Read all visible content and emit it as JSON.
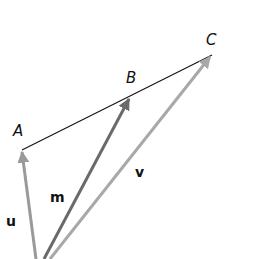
{
  "diagram": {
    "points": [
      {
        "name": "A",
        "x": 22,
        "y": 150,
        "label_x": 13,
        "label_y": 136
      },
      {
        "name": "B",
        "x": 130,
        "y": 97,
        "label_x": 126,
        "label_y": 83
      },
      {
        "name": "C",
        "x": 212,
        "y": 55,
        "label_x": 206,
        "label_y": 45
      }
    ],
    "origin": {
      "x": 36,
      "y": 259
    },
    "segment": {
      "from": "A",
      "to": "C",
      "color": "#111111"
    },
    "vectors": [
      {
        "name": "u",
        "to": "A",
        "color": "#9a9a9a",
        "label_x": 6,
        "label_y": 226
      },
      {
        "name": "m",
        "to": "B",
        "color": "#6a6a6a",
        "label_x": 50,
        "label_y": 202
      },
      {
        "name": "v",
        "to": "C",
        "color": "#a8a8a8",
        "label_x": 135,
        "label_y": 177
      }
    ]
  }
}
